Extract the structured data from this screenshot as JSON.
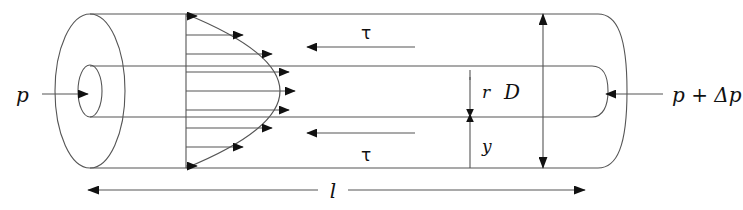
{
  "figure": {
    "kind": "fluid-flow-pipe-diagram",
    "background_color": "#ffffff",
    "line_color": "#555555",
    "bold_line_color": "#111111",
    "text_color": "#111111"
  },
  "labels": {
    "pressure_inlet": "p",
    "pressure_outlet": "p + Δp",
    "shear_top": "τ",
    "shear_bottom": "τ",
    "diameter": "D",
    "radius_offset": "r",
    "wall_distance": "y",
    "length": "l"
  },
  "geometry": {
    "tube_top_y": 14,
    "tube_bottom_y": 168,
    "core_top_y": 66,
    "core_bottom_y": 117,
    "left_cap_x": 55,
    "right_cap_x": 620,
    "profile_base_x": 186,
    "profile_apex_x": 295,
    "length_dim_left_x": 88,
    "length_dim_right_x": 585,
    "length_dim_y": 190,
    "diameter_dim_x": 543,
    "ry_dim_x": 470
  },
  "velocity_profile": {
    "type": "parabolic",
    "arrow_count": 9,
    "arrow_rows_y": [
      16,
      35,
      54,
      72,
      91,
      110,
      128,
      147,
      166
    ],
    "arrow_tip_x": [
      197,
      243,
      272,
      289,
      295,
      289,
      272,
      243,
      197
    ]
  },
  "shear_arrows": [
    {
      "name": "tau-top",
      "y": 47,
      "from_x": 415,
      "to_x": 307,
      "label_x": 366,
      "label_y": 38
    },
    {
      "name": "tau-bottom",
      "y": 133,
      "from_x": 415,
      "to_x": 307,
      "label_x": 366,
      "label_y": 160
    }
  ],
  "pressure_arrows": [
    {
      "name": "inlet",
      "y": 94,
      "from_x": 42,
      "to_x": 90,
      "label_x": 16,
      "label_y": 101
    },
    {
      "name": "outlet",
      "y": 94,
      "from_x": 660,
      "to_x": 605,
      "label_x": 672,
      "label_y": 101
    }
  ]
}
